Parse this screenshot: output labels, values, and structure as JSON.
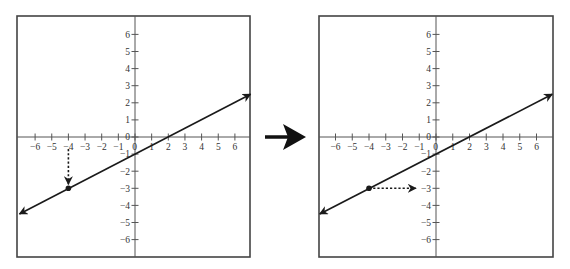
{
  "figure": {
    "colors": {
      "frame": "#444444",
      "axis": "#555555",
      "line": "#1a1a1a",
      "text": "#333333",
      "background": "#ffffff"
    },
    "transition_arrow": {
      "icon": "right-arrow-icon"
    }
  },
  "chart_data": [
    {
      "type": "line",
      "panel": "left",
      "title": "",
      "xlabel": "",
      "ylabel": "",
      "xlim": [
        -7,
        7
      ],
      "ylim": [
        -7,
        7
      ],
      "grid": false,
      "x_ticks": [
        -6,
        -5,
        -4,
        -3,
        -2,
        -1,
        0,
        1,
        2,
        3,
        4,
        5,
        6
      ],
      "y_ticks": [
        -6,
        -5,
        -4,
        -3,
        -2,
        -1,
        0,
        1,
        2,
        3,
        4,
        5,
        6
      ],
      "x_tick_labels": [
        "−6",
        "−5",
        "−4",
        "−3",
        "−2",
        "−1",
        "0",
        "1",
        "2",
        "3",
        "4",
        "5",
        "6"
      ],
      "y_tick_labels": [
        "−6",
        "−5",
        "−4",
        "−3",
        "−2",
        "−1",
        "0",
        "1",
        "2",
        "3",
        "4",
        "5",
        "6"
      ],
      "series": [
        {
          "name": "y = x/2 - 1",
          "x": [
            -7,
            7
          ],
          "y": [
            -4.5,
            2.5
          ],
          "arrows": "both"
        }
      ],
      "point": {
        "x": -4,
        "y": -3
      },
      "annotation": {
        "kind": "dotted-arrow",
        "direction": "down",
        "from": [
          -4,
          -0.7
        ],
        "to": [
          -4,
          -3
        ]
      }
    },
    {
      "type": "line",
      "panel": "right",
      "title": "",
      "xlabel": "",
      "ylabel": "",
      "xlim": [
        -7,
        7
      ],
      "ylim": [
        -7,
        7
      ],
      "grid": false,
      "x_ticks": [
        -6,
        -5,
        -4,
        -3,
        -2,
        -1,
        0,
        1,
        2,
        3,
        4,
        5,
        6
      ],
      "y_ticks": [
        -6,
        -5,
        -4,
        -3,
        -2,
        -1,
        0,
        1,
        2,
        3,
        4,
        5,
        6
      ],
      "x_tick_labels": [
        "−6",
        "−5",
        "−4",
        "−3",
        "−2",
        "−1",
        "0",
        "1",
        "2",
        "3",
        "4",
        "5",
        "6"
      ],
      "y_tick_labels": [
        "−6",
        "−5",
        "−4",
        "−3",
        "−2",
        "−1",
        "0",
        "1",
        "2",
        "3",
        "4",
        "5",
        "6"
      ],
      "series": [
        {
          "name": "y = x/2 - 1",
          "x": [
            -7,
            7
          ],
          "y": [
            -4.5,
            2.5
          ],
          "arrows": "both"
        }
      ],
      "point": {
        "x": -4,
        "y": -3
      },
      "annotation": {
        "kind": "dotted-arrow",
        "direction": "right",
        "from": [
          -4,
          -3
        ],
        "to": [
          -1.2,
          -3
        ]
      }
    }
  ]
}
